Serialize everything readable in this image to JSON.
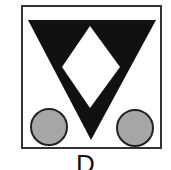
{
  "figure": {
    "caption_label": "D",
    "colors": {
      "frame": "#333333",
      "triangle": "#111111",
      "diamond": "#ffffff",
      "circle_fill": "#a6a6a6",
      "circle_stroke": "#222222"
    },
    "shapes": {
      "frame": {
        "x": 22,
        "y": 6,
        "w": 139,
        "h": 142
      },
      "triangle": {
        "points": "28,20 156,20 91,140"
      },
      "diamond": {
        "points": "90,26 120,67 90,108 62,67"
      },
      "circles": [
        {
          "name": "left-circle",
          "cx": 49,
          "cy": 127,
          "r": 18
        },
        {
          "name": "right-circle",
          "cx": 135,
          "cy": 128,
          "r": 18
        }
      ]
    }
  }
}
